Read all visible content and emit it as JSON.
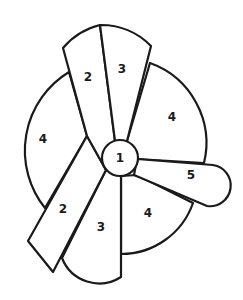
{
  "diagram": {
    "type": "radial-sector-diagram",
    "stroke_color": "#1a1a1a",
    "fill_color": "#ffffff",
    "center": {
      "label": "1"
    },
    "regions": [
      {
        "id": "top-left-strip",
        "label": "2"
      },
      {
        "id": "top-right-strip",
        "label": "3"
      },
      {
        "id": "left-sector",
        "label": "4"
      },
      {
        "id": "right-sector",
        "label": "4"
      },
      {
        "id": "lower-left-strip",
        "label": "2"
      },
      {
        "id": "lower-strip",
        "label": "3"
      },
      {
        "id": "lower-right-sector",
        "label": "4"
      },
      {
        "id": "right-petal",
        "label": "5"
      }
    ]
  }
}
